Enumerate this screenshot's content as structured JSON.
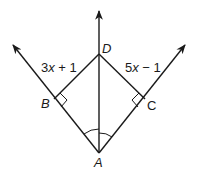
{
  "diagram": {
    "type": "geometry-angle-bisector",
    "points": {
      "A": {
        "label": "A",
        "x": 99,
        "y": 153
      },
      "B": {
        "label": "B",
        "x": 54,
        "y": 100
      },
      "C": {
        "label": "C",
        "x": 146,
        "y": 99
      },
      "D": {
        "label": "D",
        "x": 99,
        "y": 54
      }
    },
    "segments": {
      "BD": {
        "expression": "3x + 1",
        "var": "x",
        "rest": " + 1",
        "coef": "3"
      },
      "CD": {
        "expression": "5x − 1",
        "var": "x",
        "rest": " − 1",
        "coef": "5"
      }
    },
    "rays": [
      "AB (arrow up-left)",
      "AD (arrow up)",
      "AC (arrow up-right)"
    ],
    "marks": {
      "right_angles": [
        "B",
        "C"
      ],
      "congruent_angles": [
        "∠BAD",
        "∠DAC"
      ]
    },
    "colors": {
      "stroke": "#1a1a1a",
      "background": "#ffffff"
    }
  }
}
